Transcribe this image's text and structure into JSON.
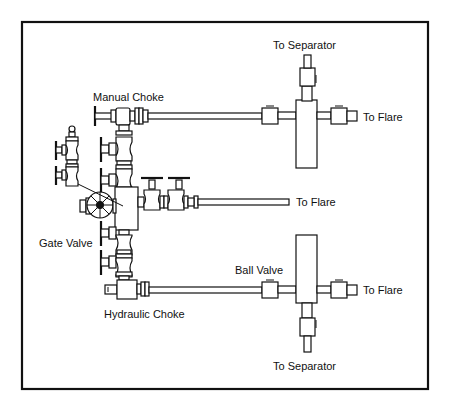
{
  "diagram": {
    "type": "choke manifold piping schematic",
    "labels": {
      "manual_choke": "Manual Choke",
      "gate_valve": "Gate Valve",
      "hydraulic_choke": "Hydraulic Choke",
      "ball_valve": "Ball Valve",
      "to_separator_top": "To Separator",
      "to_separator_bottom": "To Separator",
      "to_flare_top": "To Flare",
      "to_flare_middle": "To Flare",
      "to_flare_bottom": "To Flare"
    },
    "components": [
      {
        "id": "manual-choke",
        "label": "Manual Choke",
        "line": "upper"
      },
      {
        "id": "gate-valves",
        "label": "Gate Valve",
        "count_vertical": 4
      },
      {
        "id": "hydraulic-choke",
        "label": "Hydraulic Choke",
        "line": "lower"
      },
      {
        "id": "ball-valves",
        "label": "Ball Valve",
        "count": 6
      },
      {
        "id": "upper-cross",
        "outlets": [
          "To Separator",
          "To Flare"
        ]
      },
      {
        "id": "lower-cross",
        "outlets": [
          "To Separator",
          "To Flare"
        ]
      },
      {
        "id": "middle-line",
        "outlets": [
          "To Flare"
        ]
      }
    ],
    "colors": {
      "line": "#111111",
      "background": "#ffffff"
    }
  }
}
